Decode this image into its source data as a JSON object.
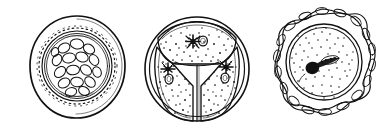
{
  "plate": {
    "background_color": "#ffffff",
    "ink_color": "#111111",
    "width": 391,
    "height": 137,
    "style": "pen-and-ink scientific line drawing",
    "figure_count": 3
  },
  "figures": [
    {
      "index": 1,
      "name": "multi-spore-cyst",
      "label": "",
      "center_x": 77,
      "center_y": 66,
      "outer_radius": 50,
      "description": "Rounded cyst with a smooth outer wall, a dotted/dashed inner ring and a dense cluster of ovoid spores filling the central cavity.",
      "parts": [
        {
          "name": "outer-wall",
          "shape": "circle",
          "radius": 50,
          "stroke_width": 1.6
        },
        {
          "name": "inner-wall-ring",
          "shape": "circle",
          "radius": 35,
          "stroke_width": 1.1
        },
        {
          "name": "dashed-ring",
          "shape": "dashed-circle",
          "radius": 38,
          "dash_count": 64
        },
        {
          "name": "spore-cavity",
          "shape": "circle",
          "radius": 31,
          "stroke_width": 1.0
        },
        {
          "name": "spore-cluster",
          "shape": "ovoid-cluster",
          "count": 17
        }
      ],
      "spore_count": 17
    },
    {
      "index": 2,
      "name": "three-compartment-sporocyst",
      "label": "",
      "center_x": 197,
      "center_y": 67,
      "outer_radius": 52,
      "description": "Rounded sporocyst divided into three wedge-shaped stippled compartments, each containing a dark stellate nucleus and a small ring-shaped vacuole; enclosed by a double outer wall.",
      "parts": [
        {
          "name": "outer-wall-outer-line",
          "shape": "circle",
          "radius": 52,
          "stroke_width": 1.5
        },
        {
          "name": "outer-wall-inner-line",
          "shape": "circle",
          "radius": 47,
          "stroke_width": 1.2
        },
        {
          "name": "compartment-top",
          "shape": "wedge",
          "stipple": true
        },
        {
          "name": "compartment-lower-left",
          "shape": "wedge",
          "stipple": true
        },
        {
          "name": "compartment-lower-right",
          "shape": "wedge",
          "stipple": true
        }
      ],
      "compartment_count": 3,
      "nuclei_count": 3,
      "vacuole_count": 3,
      "stipple_density": "dense"
    },
    {
      "index": 3,
      "name": "braided-capsule-cell",
      "label": "",
      "center_x": 322,
      "center_y": 66,
      "outer_radius": 56,
      "description": "Cell surrounded by a thick braided, chain-like capsular ring; inside, a double-lined membrane encloses finely stippled cytoplasm with a dark elongate chromatin mass.",
      "parts": [
        {
          "name": "braided-capsule-ring",
          "shape": "braided-ring",
          "radius": 52,
          "loop_count": 26
        },
        {
          "name": "membrane-outer-line",
          "shape": "circle",
          "radius": 38,
          "stroke_width": 1.3
        },
        {
          "name": "membrane-inner-line",
          "shape": "circle",
          "radius": 34,
          "stroke_width": 1.1
        },
        {
          "name": "cytoplasm-stipple",
          "shape": "stipple-field",
          "radius": 32
        },
        {
          "name": "chromatin-mass",
          "shape": "elongate-blob"
        }
      ],
      "nucleus_count": 1,
      "stipple_density": "medium"
    }
  ]
}
